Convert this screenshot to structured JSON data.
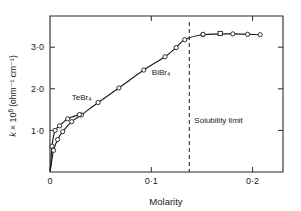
{
  "chart_data": {
    "type": "line",
    "title": "",
    "xlabel": "Molarity",
    "ylabel": "k × 10⁶ (ohm⁻¹ cm⁻¹)",
    "ylabel_parts": {
      "symbol": "k",
      "factor": "× 10",
      "exponent": "6",
      "units": "(ohm⁻¹ cm⁻¹)"
    },
    "xlim": [
      0,
      0.23
    ],
    "ylim": [
      0,
      3.75
    ],
    "xticks": [
      0,
      0.1,
      0.2
    ],
    "xticklabels": [
      "0",
      "0·1",
      "0·2"
    ],
    "yticks": [
      1.0,
      2.0,
      3.0
    ],
    "yticklabels": [
      "1·0",
      "2·0",
      "3·0"
    ],
    "grid": false,
    "legend_position": "inline-annotations",
    "frame": "box",
    "minor_ticks_right": true,
    "annotations": [
      {
        "name": "solubility-limit",
        "text": "Solubility limit",
        "x": 0.1375,
        "type": "vertical-dashed-line",
        "label_x": 0.1425,
        "label_y": 1.18
      }
    ],
    "series": [
      {
        "name": "BiBr₄",
        "label": "BiBr₄",
        "label_x": 0.1005,
        "label_y": 2.32,
        "marker": "circle",
        "points": [
          {
            "x": 0.0008,
            "y": 0.12
          },
          {
            "x": 0.0035,
            "y": 0.52
          },
          {
            "x": 0.0075,
            "y": 0.78
          },
          {
            "x": 0.0125,
            "y": 0.97
          },
          {
            "x": 0.0215,
            "y": 1.21
          },
          {
            "x": 0.031,
            "y": 1.37
          },
          {
            "x": 0.0475,
            "y": 1.67
          },
          {
            "x": 0.068,
            "y": 2.02
          },
          {
            "x": 0.0925,
            "y": 2.45
          },
          {
            "x": 0.1135,
            "y": 2.77
          },
          {
            "x": 0.1245,
            "y": 2.99
          },
          {
            "x": 0.133,
            "y": 3.18
          },
          {
            "x": 0.151,
            "y": 3.3
          },
          {
            "x": 0.1805,
            "y": 3.32
          },
          {
            "x": 0.2075,
            "y": 3.3
          }
        ]
      },
      {
        "name": "TeBr₄",
        "label": "TeBr₄",
        "label_x": 0.0215,
        "label_y": 1.72,
        "marker": "circle",
        "points": [
          {
            "x": 0.0005,
            "y": 0.05
          },
          {
            "x": 0.002,
            "y": 0.62
          },
          {
            "x": 0.005,
            "y": 1.0
          },
          {
            "x": 0.0095,
            "y": 1.11
          },
          {
            "x": 0.0175,
            "y": 1.28
          },
          {
            "x": 0.029,
            "y": 1.38
          }
        ]
      }
    ],
    "plateau_markers": [
      {
        "x": 0.151,
        "y": 3.31,
        "shape": "circle"
      },
      {
        "x": 0.168,
        "y": 3.33,
        "shape": "square"
      },
      {
        "x": 0.195,
        "y": 3.31,
        "shape": "circle"
      },
      {
        "x": 0.214,
        "y": 3.31,
        "shape": "none"
      }
    ]
  }
}
